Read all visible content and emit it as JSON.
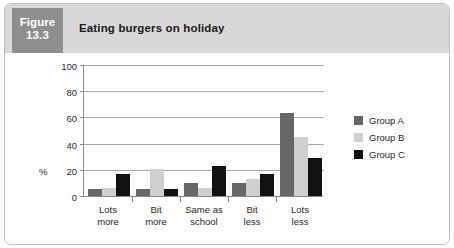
{
  "figure": {
    "number_line1": "Figure",
    "number_line2": "13.3",
    "title": "Eating burgers on holiday"
  },
  "colors": {
    "panel_border": "#b9bfc6",
    "header_background": "#d8d8d8",
    "figure_number_background": "#8e8e8e",
    "group_a": "#666666",
    "group_b": "#cfcfcf",
    "group_c": "#111111",
    "gridline": "#a8a8a8",
    "axis": "#8c8c8c"
  },
  "chart_data": {
    "type": "bar",
    "title": "Eating burgers on holiday",
    "xlabel": "",
    "ylabel": "%",
    "categories": [
      "Lots more",
      "Bit more",
      "Same as school",
      "Bit less",
      "Lots less"
    ],
    "category_lines": [
      [
        "Lots",
        "more"
      ],
      [
        "Bit",
        "more"
      ],
      [
        "Same as",
        "school"
      ],
      [
        "Bit",
        "less"
      ],
      [
        "Lots",
        "less"
      ]
    ],
    "series": [
      {
        "name": "Group A",
        "color": "#666666",
        "values": [
          5,
          5,
          10,
          10,
          63
        ]
      },
      {
        "name": "Group B",
        "color": "#cfcfcf",
        "values": [
          6,
          21,
          6,
          13,
          45
        ]
      },
      {
        "name": "Group C",
        "color": "#111111",
        "values": [
          17,
          5,
          23,
          17,
          29
        ]
      }
    ],
    "ylim": [
      0,
      100
    ],
    "yticks": [
      0,
      20,
      40,
      60,
      80,
      100
    ],
    "ytick_labels": [
      "0",
      "20",
      "40",
      "60",
      "80",
      "100"
    ],
    "grid": true,
    "grid_axis": "y",
    "legend_position": "right"
  }
}
